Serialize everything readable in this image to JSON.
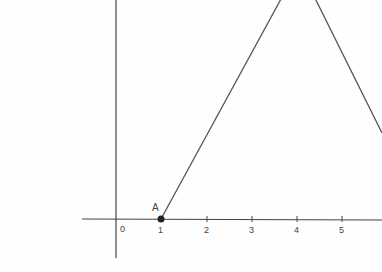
{
  "diagram": {
    "type": "coordinate-graph",
    "x_axis": {
      "origin_label": "0",
      "ticks": [
        "1",
        "2",
        "3",
        "4",
        "5"
      ]
    },
    "point": {
      "label": "A",
      "x": 1,
      "y": 0
    },
    "shape": "triangle-peak",
    "colors": {
      "line": "#555555",
      "axis": "#444444",
      "point": "#222222"
    }
  }
}
